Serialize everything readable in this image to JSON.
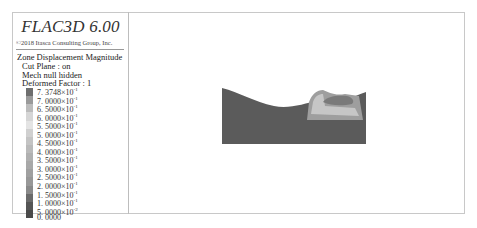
{
  "app": {
    "title": "FLAC3D 6.00",
    "copyright": "©2018 Itasca Consulting Group, Inc."
  },
  "legend": {
    "plot_name": "Zone Displacement Magnitude",
    "cut_plane": "Cut Plane : on",
    "mech": "Mech  null hidden",
    "deformed_factor": "Deformed Factor : 1",
    "entries": [
      {
        "mantissa": "7. 3748",
        "exp": "-1",
        "color": "#6e6e6e"
      },
      {
        "mantissa": "7. 0000",
        "exp": "-1",
        "color": "#9a9a9a"
      },
      {
        "mantissa": "6. 5000",
        "exp": "-1",
        "color": "#bcbcbc"
      },
      {
        "mantissa": "6. 0000",
        "exp": "-1",
        "color": "#d6d6d6"
      },
      {
        "mantissa": "5. 5000",
        "exp": "-1",
        "color": "#e4e4e4"
      },
      {
        "mantissa": "5. 0000",
        "exp": "-1",
        "color": "#d0d0d0"
      },
      {
        "mantissa": "4. 5000",
        "exp": "-1",
        "color": "#c4c4c4"
      },
      {
        "mantissa": "4. 0000",
        "exp": "-1",
        "color": "#bababa"
      },
      {
        "mantissa": "3. 5000",
        "exp": "-1",
        "color": "#b0b0b0"
      },
      {
        "mantissa": "3. 0000",
        "exp": "-1",
        "color": "#a8a8a8"
      },
      {
        "mantissa": "2. 5000",
        "exp": "-1",
        "color": "#a0a0a0"
      },
      {
        "mantissa": "2. 0000",
        "exp": "-1",
        "color": "#989898"
      },
      {
        "mantissa": "1. 5000",
        "exp": "-1",
        "color": "#8a8a8a"
      },
      {
        "mantissa": "1. 0000",
        "exp": "-1",
        "color": "#6a6a6a"
      },
      {
        "mantissa": "5. 0000",
        "exp": "-2",
        "color": "#555555"
      },
      {
        "mantissa": "0. 0000",
        "exp": "",
        "color": "#4a4a4a"
      }
    ]
  },
  "viewport": {
    "model_colors": {
      "base": "#5b5b5b",
      "pad": "#9e9e9e",
      "pad_light": "#c6c6c6",
      "pit": "#7a7a7a"
    }
  }
}
